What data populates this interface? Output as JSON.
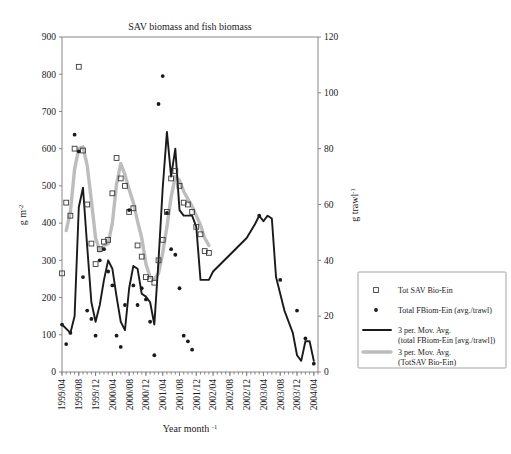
{
  "chart_data": {
    "type": "line",
    "title": "SAV biomass and fish biomass",
    "xlabel": "Year month",
    "xlabel_sup": "-1",
    "ylabel_left": "g m",
    "ylabel_left_sup": "-2",
    "ylabel_right": "g trawl",
    "ylabel_right_sup": "-1",
    "grid": false,
    "legend_position": "right-outside",
    "ylim_left": [
      0,
      900
    ],
    "ylim_right": [
      0,
      120
    ],
    "yticks_left": [
      0,
      100,
      200,
      300,
      400,
      500,
      600,
      700,
      800,
      900
    ],
    "yticks_right": [
      0,
      20,
      40,
      60,
      80,
      100,
      120
    ],
    "xtick_labels": [
      "1999/04",
      "1999/08",
      "1999/12",
      "2000/04",
      "2000/08",
      "2000/12",
      "2001/04",
      "2001/08",
      "2001/12",
      "2002/04",
      "2002/08",
      "2002/12",
      "2003/04",
      "2003/08",
      "2003/12",
      "2004/04"
    ],
    "x_index_range": [
      0,
      61
    ],
    "x_tick_indices": [
      0,
      4,
      8,
      12,
      16,
      20,
      24,
      28,
      32,
      36,
      40,
      44,
      48,
      52,
      56,
      60
    ],
    "series": [
      {
        "name": "Tot SAV Bio-Ein",
        "marker": "open-square",
        "axis": "left",
        "unit": "g m-2",
        "points": [
          {
            "x": 0,
            "y": 265
          },
          {
            "x": 1,
            "y": 455
          },
          {
            "x": 2,
            "y": 420
          },
          {
            "x": 3,
            "y": 600
          },
          {
            "x": 4,
            "y": 820
          },
          {
            "x": 5,
            "y": 595
          },
          {
            "x": 6,
            "y": 450
          },
          {
            "x": 7,
            "y": 345
          },
          {
            "x": 8,
            "y": 290
          },
          {
            "x": 9,
            "y": 330
          },
          {
            "x": 10,
            "y": 350
          },
          {
            "x": 11,
            "y": 355
          },
          {
            "x": 12,
            "y": 480
          },
          {
            "x": 13,
            "y": 575
          },
          {
            "x": 14,
            "y": 520
          },
          {
            "x": 15,
            "y": 500
          },
          {
            "x": 16,
            "y": 430
          },
          {
            "x": 17,
            "y": 440
          },
          {
            "x": 18,
            "y": 340
          },
          {
            "x": 19,
            "y": 310
          },
          {
            "x": 20,
            "y": 255
          },
          {
            "x": 21,
            "y": 250
          },
          {
            "x": 22,
            "y": 240
          },
          {
            "x": 23,
            "y": 300
          },
          {
            "x": 24,
            "y": 355
          },
          {
            "x": 25,
            "y": 430
          },
          {
            "x": 26,
            "y": 520
          },
          {
            "x": 27,
            "y": 540
          },
          {
            "x": 28,
            "y": 500
          },
          {
            "x": 29,
            "y": 455
          },
          {
            "x": 30,
            "y": 450
          },
          {
            "x": 31,
            "y": 430
          },
          {
            "x": 32,
            "y": 390
          },
          {
            "x": 33,
            "y": 370
          },
          {
            "x": 34,
            "y": 325
          },
          {
            "x": 35,
            "y": 320
          }
        ]
      },
      {
        "name": "Total FBiom-Ein (avg./trawl)",
        "marker": "filled-circle",
        "axis": "right",
        "unit": "g trawl-1",
        "points": [
          {
            "x": 0,
            "y": 17
          },
          {
            "x": 1,
            "y": 10
          },
          {
            "x": 2,
            "y": 14
          },
          {
            "x": 3,
            "y": 85
          },
          {
            "x": 4,
            "y": 79
          },
          {
            "x": 5,
            "y": 34
          },
          {
            "x": 6,
            "y": 22
          },
          {
            "x": 7,
            "y": 19
          },
          {
            "x": 8,
            "y": 13
          },
          {
            "x": 9,
            "y": 40
          },
          {
            "x": 10,
            "y": 44
          },
          {
            "x": 11,
            "y": 36
          },
          {
            "x": 12,
            "y": 31
          },
          {
            "x": 13,
            "y": 13
          },
          {
            "x": 14,
            "y": 9
          },
          {
            "x": 15,
            "y": 24
          },
          {
            "x": 16,
            "y": 58
          },
          {
            "x": 17,
            "y": 31
          },
          {
            "x": 18,
            "y": 24
          },
          {
            "x": 19,
            "y": 30
          },
          {
            "x": 20,
            "y": 26
          },
          {
            "x": 21,
            "y": 18
          },
          {
            "x": 22,
            "y": 6
          },
          {
            "x": 23,
            "y": 96
          },
          {
            "x": 24,
            "y": 106
          },
          {
            "x": 25,
            "y": 57
          },
          {
            "x": 26,
            "y": 44
          },
          {
            "x": 27,
            "y": 42
          },
          {
            "x": 28,
            "y": 30
          },
          {
            "x": 29,
            "y": 13
          },
          {
            "x": 30,
            "y": 11
          },
          {
            "x": 31,
            "y": 8
          },
          {
            "x": 47,
            "y": 56
          },
          {
            "x": 52,
            "y": 33
          },
          {
            "x": 56,
            "y": 22
          },
          {
            "x": 58,
            "y": 12
          },
          {
            "x": 60,
            "y": 3
          }
        ]
      },
      {
        "name": "3 per. Mov. Avg. (total FBiom-Ein [avg./trawl])",
        "style": "solid-black-line",
        "axis": "right",
        "values": [
          {
            "x": 0,
            "y": 17
          },
          {
            "x": 2,
            "y": 14
          },
          {
            "x": 3,
            "y": 20
          },
          {
            "x": 4,
            "y": 59
          },
          {
            "x": 5,
            "y": 66
          },
          {
            "x": 6,
            "y": 45
          },
          {
            "x": 7,
            "y": 25
          },
          {
            "x": 8,
            "y": 18
          },
          {
            "x": 9,
            "y": 24
          },
          {
            "x": 10,
            "y": 33
          },
          {
            "x": 11,
            "y": 40
          },
          {
            "x": 12,
            "y": 37
          },
          {
            "x": 13,
            "y": 27
          },
          {
            "x": 14,
            "y": 18
          },
          {
            "x": 15,
            "y": 15
          },
          {
            "x": 16,
            "y": 30
          },
          {
            "x": 17,
            "y": 38
          },
          {
            "x": 18,
            "y": 37
          },
          {
            "x": 19,
            "y": 28
          },
          {
            "x": 20,
            "y": 27
          },
          {
            "x": 21,
            "y": 25
          },
          {
            "x": 22,
            "y": 17
          },
          {
            "x": 23,
            "y": 40
          },
          {
            "x": 24,
            "y": 66
          },
          {
            "x": 25,
            "y": 86
          },
          {
            "x": 26,
            "y": 70
          },
          {
            "x": 27,
            "y": 80
          },
          {
            "x": 28,
            "y": 58
          },
          {
            "x": 29,
            "y": 56
          },
          {
            "x": 30,
            "y": 56
          },
          {
            "x": 31,
            "y": 56
          },
          {
            "x": 32,
            "y": 52
          },
          {
            "x": 33,
            "y": 33
          },
          {
            "x": 35,
            "y": 33
          },
          {
            "x": 36,
            "y": 36
          },
          {
            "x": 40,
            "y": 42
          },
          {
            "x": 44,
            "y": 48
          },
          {
            "x": 46,
            "y": 53
          },
          {
            "x": 47,
            "y": 56
          },
          {
            "x": 48,
            "y": 54
          },
          {
            "x": 49,
            "y": 56
          },
          {
            "x": 50,
            "y": 55
          },
          {
            "x": 51,
            "y": 34
          },
          {
            "x": 53,
            "y": 22
          },
          {
            "x": 55,
            "y": 14
          },
          {
            "x": 56,
            "y": 6
          },
          {
            "x": 57,
            "y": 4
          },
          {
            "x": 58,
            "y": 11
          },
          {
            "x": 59,
            "y": 11
          },
          {
            "x": 60,
            "y": 4
          }
        ]
      },
      {
        "name": "3 per. Mov. Avg. (TotSAV Bio-Ein)",
        "style": "thick-gray-line",
        "axis": "left",
        "values": [
          {
            "x": 1,
            "y": 380
          },
          {
            "x": 2,
            "y": 430
          },
          {
            "x": 3,
            "y": 545
          },
          {
            "x": 4,
            "y": 600
          },
          {
            "x": 5,
            "y": 605
          },
          {
            "x": 6,
            "y": 555
          },
          {
            "x": 7,
            "y": 460
          },
          {
            "x": 8,
            "y": 360
          },
          {
            "x": 9,
            "y": 325
          },
          {
            "x": 10,
            "y": 340
          },
          {
            "x": 11,
            "y": 345
          },
          {
            "x": 12,
            "y": 400
          },
          {
            "x": 13,
            "y": 505
          },
          {
            "x": 14,
            "y": 560
          },
          {
            "x": 15,
            "y": 530
          },
          {
            "x": 16,
            "y": 490
          },
          {
            "x": 17,
            "y": 455
          },
          {
            "x": 18,
            "y": 405
          },
          {
            "x": 19,
            "y": 360
          },
          {
            "x": 20,
            "y": 290
          },
          {
            "x": 21,
            "y": 255
          },
          {
            "x": 22,
            "y": 250
          },
          {
            "x": 23,
            "y": 265
          },
          {
            "x": 24,
            "y": 320
          },
          {
            "x": 25,
            "y": 390
          },
          {
            "x": 26,
            "y": 470
          },
          {
            "x": 27,
            "y": 525
          },
          {
            "x": 28,
            "y": 515
          },
          {
            "x": 29,
            "y": 485
          },
          {
            "x": 30,
            "y": 465
          },
          {
            "x": 31,
            "y": 445
          },
          {
            "x": 32,
            "y": 420
          },
          {
            "x": 33,
            "y": 395
          },
          {
            "x": 34,
            "y": 360
          },
          {
            "x": 35,
            "y": 340
          }
        ]
      }
    ]
  },
  "legend": {
    "items": [
      {
        "label": "Tot SAV Bio-Ein",
        "marker": "open-square"
      },
      {
        "label": "Total FBiom-Ein (avg./trawl)",
        "marker": "filled-circle"
      },
      {
        "label_line1": "3 per. Mov. Avg.",
        "label_line2": "(total FBiom-Ein [avg./trawl])",
        "marker": "black-line"
      },
      {
        "label_line1": "3 per. Mov. Avg.",
        "label_line2": "(TotSAV Bio-Ein)",
        "marker": "gray-line"
      }
    ]
  },
  "colors": {
    "black_series": "#1a1a1a",
    "gray_series": "#bdbdbd",
    "axis": "#7a7a7a",
    "background": "#ffffff"
  }
}
